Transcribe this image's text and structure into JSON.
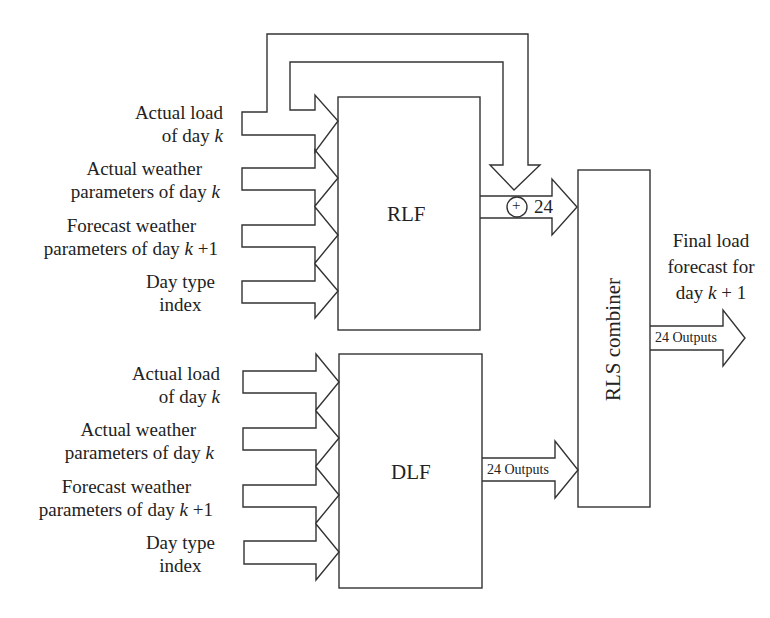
{
  "blocks": {
    "rlf": {
      "label": "RLF"
    },
    "dlf": {
      "label": "DLF"
    },
    "combiner": {
      "label": "RLS combiner"
    }
  },
  "rlf_inputs": [
    {
      "line1": "Actual load",
      "line2_pre": "of day ",
      "line2_var": "k",
      "line2_post": ""
    },
    {
      "line1": "Actual weather",
      "line2_pre": "parameters of day ",
      "line2_var": "k",
      "line2_post": ""
    },
    {
      "line1": "Forecast weather",
      "line2_pre": "parameters of day ",
      "line2_var": "k",
      "line2_post": " +1"
    },
    {
      "line1": "Day type",
      "line2_pre": "index",
      "line2_var": "",
      "line2_post": ""
    }
  ],
  "dlf_inputs": [
    {
      "line1": "Actual load",
      "line2_pre": "of day ",
      "line2_var": "k",
      "line2_post": ""
    },
    {
      "line1": "Actual weather",
      "line2_pre": "parameters of day ",
      "line2_var": "k",
      "line2_post": ""
    },
    {
      "line1": "Forecast weather",
      "line2_pre": "parameters of day ",
      "line2_var": "k",
      "line2_post": " +1"
    },
    {
      "line1": "Day type",
      "line2_pre": "index",
      "line2_var": "",
      "line2_post": ""
    }
  ],
  "rlf_output": {
    "label": "24",
    "summing_symbol": "+"
  },
  "dlf_output": {
    "label": "24 Outputs"
  },
  "combiner_output": {
    "label": "24 Outputs"
  },
  "final_output": {
    "line1": "Final load",
    "line2": "forecast for",
    "line3_pre": "day ",
    "line3_var": "k",
    "line3_post": " + 1"
  },
  "colors": {
    "stroke": "#333333",
    "background": "#ffffff",
    "text": "#222222"
  }
}
